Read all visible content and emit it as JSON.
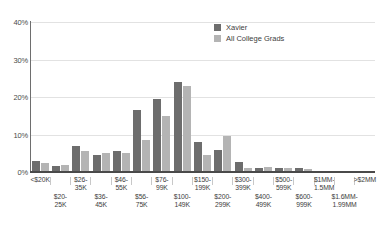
{
  "chart_data": {
    "type": "bar",
    "title": "",
    "xlabel": "",
    "ylabel": "",
    "ylim": [
      0,
      40
    ],
    "yticks": [
      "0%",
      "10%",
      "20%",
      "30%",
      "40%"
    ],
    "ytick_values": [
      0,
      10,
      20,
      30,
      40
    ],
    "grid": true,
    "legend_position": "top-right",
    "categories": [
      "<$20K",
      "$20-25K",
      "$26-35K",
      "$36-45K",
      "$46-55K",
      "$56-75K",
      "$76-99K",
      "$100-149K",
      "$150-199K",
      "$200-299K",
      "$300-399K",
      "$400-499K",
      "$500-599K",
      "$600-999K",
      "$1MM-1.5MM",
      "$1.6MM-1.99MM",
      ">$2MM"
    ],
    "category_labels": [
      {
        "line1": "<$20K",
        "line2": "",
        "row": "top"
      },
      {
        "line1": "$20-",
        "line2": "25K",
        "row": "bot"
      },
      {
        "line1": "$26-",
        "line2": "35K",
        "row": "top"
      },
      {
        "line1": "$36-",
        "line2": "45K",
        "row": "bot"
      },
      {
        "line1": "$46-",
        "line2": "55K",
        "row": "top"
      },
      {
        "line1": "$56-",
        "line2": "75K",
        "row": "bot"
      },
      {
        "line1": "$76-",
        "line2": "99K",
        "row": "top"
      },
      {
        "line1": "$100-",
        "line2": "149K",
        "row": "bot"
      },
      {
        "line1": "$150-",
        "line2": "199K",
        "row": "top"
      },
      {
        "line1": "$200-",
        "line2": "299K",
        "row": "bot"
      },
      {
        "line1": "$300-",
        "line2": "399K",
        "row": "top"
      },
      {
        "line1": "$400-",
        "line2": "499K",
        "row": "bot"
      },
      {
        "line1": "$500-",
        "line2": "599K",
        "row": "top"
      },
      {
        "line1": "$600-",
        "line2": "999K",
        "row": "bot"
      },
      {
        "line1": "$1MM-",
        "line2": "1.5MM",
        "row": "top"
      },
      {
        "line1": "$1.6MM-",
        "line2": "1.99MM",
        "row": "bot"
      },
      {
        "line1": ">$2MM",
        "line2": "",
        "row": "top"
      }
    ],
    "series": [
      {
        "name": "Xavier",
        "color": "#6d6d6d",
        "values": [
          3.0,
          1.5,
          7.0,
          4.5,
          5.5,
          16.5,
          19.5,
          24.0,
          8.0,
          6.0,
          2.8,
          1.0,
          1.0,
          1.0,
          0.4,
          0.3,
          0.2
        ]
      },
      {
        "name": "All College Grads",
        "color": "#b4b4b4",
        "values": [
          2.5,
          2.0,
          5.5,
          5.0,
          5.0,
          8.5,
          15.0,
          23.0,
          4.5,
          9.5,
          1.2,
          1.3,
          1.0,
          0.8,
          0.3,
          0.2,
          0.1
        ]
      }
    ]
  },
  "legend": {
    "items": [
      {
        "label": "Xavier",
        "color": "#6d6d6d"
      },
      {
        "label": "All College Grads",
        "color": "#b4b4b4"
      }
    ]
  },
  "colors": {
    "series_primary": "#6d6d6d",
    "series_secondary": "#b4b4b4",
    "gridline": "#e2e2e2",
    "axis": "#4a4a4a",
    "background": "#ffffff",
    "text": "#3d3d3d"
  }
}
